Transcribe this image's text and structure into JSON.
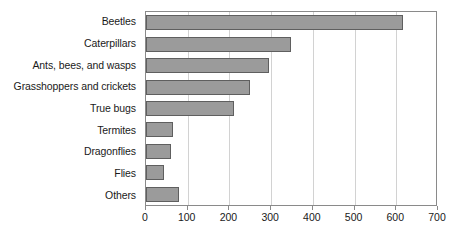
{
  "chart_data": {
    "type": "bar",
    "orientation": "horizontal",
    "title": "",
    "subtitle": "",
    "xlabel": "",
    "ylabel": "",
    "categories": [
      "Beetles",
      "Caterpillars",
      "Ants, bees, and wasps",
      "Grasshoppers and crickets",
      "True bugs",
      "Termites",
      "Dragonflies",
      "Flies",
      "Others"
    ],
    "values": [
      617,
      348,
      295,
      250,
      211,
      65,
      60,
      43,
      80
    ],
    "xlim": [
      0,
      700
    ],
    "xticks": [
      0,
      100,
      200,
      300,
      400,
      500,
      600,
      700
    ],
    "xtick_labels": [
      "0",
      "100",
      "200",
      "300",
      "400",
      "500",
      "600",
      "700"
    ],
    "grid": "vertical",
    "legend": "none",
    "bar_fill_color": "#9b9b9b",
    "bar_border_color": "#5f5f5f",
    "gridline_color": "#d2d2d2",
    "frame_color": "#8a8a8a",
    "text_color": "#1a1a1a",
    "background_color": "#ffffff"
  }
}
